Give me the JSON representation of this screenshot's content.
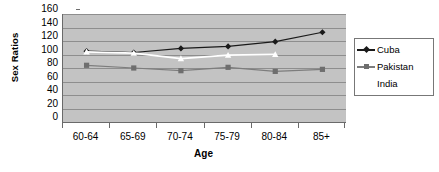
{
  "chart_data": {
    "type": "line",
    "title": "",
    "xlabel": "Age",
    "ylabel": "Sex Ratios",
    "categories": [
      "60-64",
      "65-69",
      "70-74",
      "75-79",
      "80-84",
      "85+"
    ],
    "ylim": [
      0,
      160
    ],
    "ytick_step": 20,
    "yticks": [
      0,
      20,
      40,
      60,
      80,
      100,
      120,
      140,
      160
    ],
    "ytick_labels": [
      "0",
      "20",
      "40",
      "60",
      "80",
      "100",
      "120",
      "140",
      "160"
    ],
    "grid": true,
    "legend_position": "right",
    "plot_background": "#c3c3c3",
    "gridline_color": "#8e8e8e",
    "axis_color": "#6a6a6a",
    "series": [
      {
        "name": "Cuba",
        "color": "#1a1a1a",
        "marker": "diamond",
        "marker_color": "#1a1a1a",
        "values": [
          105,
          103,
          109,
          112,
          119,
          133
        ]
      },
      {
        "name": "Pakistan",
        "color": "#7d7d7d",
        "marker": "square",
        "marker_color": "#6e6e6e",
        "values": [
          84,
          80,
          76,
          81,
          75,
          78
        ]
      },
      {
        "name": "India",
        "color": "#ffffff",
        "marker": "triangle",
        "marker_color": "#ffffff",
        "values": [
          104,
          102,
          94,
          99,
          100,
          null
        ]
      }
    ]
  },
  "legend": {
    "entries": [
      {
        "label": "Cuba"
      },
      {
        "label": "Pakistan"
      },
      {
        "label": "India"
      }
    ]
  }
}
